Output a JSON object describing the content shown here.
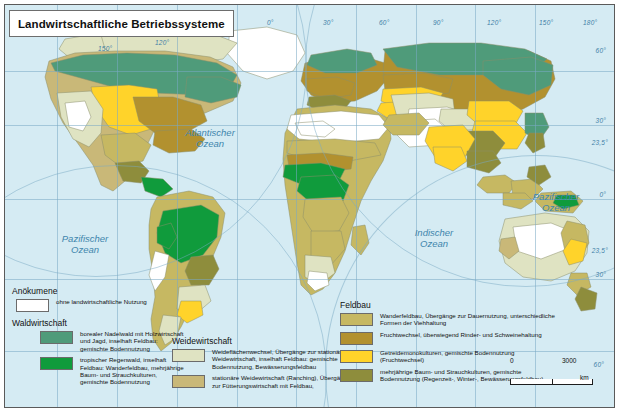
{
  "title": "Landwirtschaftliche Betriebssysteme",
  "ocean_labels": [
    {
      "name": "Atlantischer Ozean",
      "line1": "Atlantischer",
      "line2": "Ozean"
    },
    {
      "name": "Pazifischer Ozean West",
      "line1": "Pazifischer",
      "line2": "Ozean"
    },
    {
      "name": "Pazifischer Ozean Ost",
      "line1": "Pazifischer",
      "line2": "Ozean"
    },
    {
      "name": "Indischer Ozean",
      "line1": "Indischer",
      "line2": "Ozean"
    }
  ],
  "graticule": {
    "longitude_labels": [
      "60°",
      "30°",
      "0°",
      "30°",
      "60°",
      "90°",
      "120°",
      "150°",
      "180°"
    ],
    "longitude_extra": [
      "150°",
      "120°"
    ],
    "latitude_labels_right": [
      "60°",
      "30°",
      "23,5°",
      "0°",
      "23,5°",
      "30°",
      "60°"
    ]
  },
  "legend": {
    "anoekumene": {
      "heading": "Anökumene",
      "items": [
        {
          "color": "#ffffff",
          "text": "ohne landwirtschaftliche Nutzung"
        }
      ]
    },
    "waldwirtschaft": {
      "heading": "Waldwirtschaft",
      "items": [
        {
          "color": "#4f9b7a",
          "text": "borealer Nadelwald mit Holzwirtschaft und Jagd, inselhaft Feldbau: gemischte Bodennutzung"
        },
        {
          "color": "#109b3c",
          "text": "tropischer Regenwald, inselhaft Feldbau: Wanderfeldbau, mehrjährige Baum- und Strauchkulturen, gemischte Bodennutzung"
        }
      ]
    },
    "weidewirtschaft": {
      "heading": "Weidewirtschaft",
      "items": [
        {
          "color": "#dfe3c2",
          "text": "Weideflächenwechsel, Übergänge zur stationären Weidewirtschaft, inselhaft Feldbau: gemischte Bodennutzung, Bewässerungsfeldbau"
        },
        {
          "color": "#c9b878",
          "text": "stationäre Weidewirtschaft (Ranching), Übergänge zur Fütterungswirtschaft mit Feldbau,"
        }
      ]
    },
    "feldbau": {
      "heading": "Feldbau",
      "items": [
        {
          "color": "#c6b862",
          "text": "Wanderfeldbau, Übergänge zur Dauernutzung, unterschiedliche Formen der Viehhaltung"
        },
        {
          "color": "#b2912f",
          "text": "Fruchtwechsel, überwiegend Rinder- und Schweinehaltung"
        },
        {
          "color": "#ffd32a",
          "text": "Getreidemonokulturen, gemischte Bodennutzung (Fruchtwechsel)"
        },
        {
          "color": "#8e8d3c",
          "text": "mehrjährige Baum- und Strauchkulturen, gemischte Bodennutzung (Regenzeit-, Winter-, Bewässerungsfeldbau)"
        }
      ]
    }
  },
  "scale": {
    "min": "0",
    "max": "3000",
    "unit": "km"
  },
  "colors": {
    "ocean": "#d5ebf3",
    "boreal_forest": "#4f9b7a",
    "rainforest": "#109b3c",
    "pasture_light": "#dfe3c2",
    "pasture_ranch": "#c9b878",
    "shifting_crop": "#c6b862",
    "rotation_crop": "#b2912f",
    "grain_mono": "#ffd32a",
    "perennial": "#8e8d3c",
    "uncultivated": "#ffffff",
    "graticule": "#7aa9c4",
    "label_blue": "#3f86ad"
  }
}
